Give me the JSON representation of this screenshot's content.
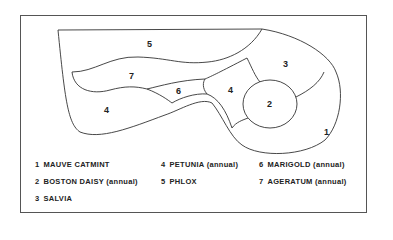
{
  "diagram": {
    "type": "garden-bed-plan",
    "beds": [
      {
        "id": "1",
        "label": "1",
        "x": 324,
        "y": 132
      },
      {
        "id": "2",
        "label": "2",
        "x": 269,
        "y": 106
      },
      {
        "id": "3",
        "label": "3",
        "x": 286,
        "y": 65
      },
      {
        "id": "4a",
        "label": "4",
        "x": 230,
        "y": 91
      },
      {
        "id": "4b",
        "label": "4",
        "x": 107,
        "y": 111
      },
      {
        "id": "5",
        "label": "5",
        "x": 150,
        "y": 46
      },
      {
        "id": "6",
        "label": "6",
        "x": 179,
        "y": 92
      },
      {
        "id": "7",
        "label": "7",
        "x": 131,
        "y": 77
      }
    ]
  },
  "legend": {
    "items": [
      {
        "num": "1",
        "name": "MAUVE CATMINT",
        "note": ""
      },
      {
        "num": "2",
        "name": "BOSTON DAISY",
        "note": "(annual)"
      },
      {
        "num": "3",
        "name": "SALVIA",
        "note": ""
      },
      {
        "num": "4",
        "name": "PETUNIA",
        "note": "(annual)"
      },
      {
        "num": "5",
        "name": "PHLOX",
        "note": ""
      },
      {
        "num": "6",
        "name": "MARIGOLD",
        "note": "(annual)"
      },
      {
        "num": "7",
        "name": "AGERATUM",
        "note": "(annual)"
      }
    ]
  },
  "colors": {
    "line": "#333333",
    "text": "#222222",
    "background": "#ffffff"
  }
}
